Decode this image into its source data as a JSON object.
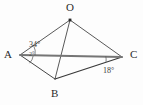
{
  "figure": {
    "kind": "geometry-line-diagram",
    "background_color": "#fdfdfd",
    "line_color": "#3c3c3c",
    "baseline_color": "#6e6e6e",
    "width": 143,
    "height": 105
  },
  "vertices": [
    {
      "id": "O",
      "label": "O",
      "x": 70,
      "y": 20,
      "has_dot": true
    },
    {
      "id": "A",
      "label": "A",
      "x": 20,
      "y": 55,
      "has_dot": false
    },
    {
      "id": "B",
      "label": "B",
      "x": 55,
      "y": 79,
      "has_dot": false
    },
    {
      "id": "C",
      "label": "C",
      "x": 122,
      "y": 57,
      "has_dot": false
    }
  ],
  "edges": [
    {
      "id": "OA",
      "from": "O",
      "to": "A",
      "style": "thin"
    },
    {
      "id": "OB",
      "from": "O",
      "to": "B",
      "style": "thin"
    },
    {
      "id": "OC",
      "from": "O",
      "to": "C",
      "style": "thin"
    },
    {
      "id": "AB",
      "from": "A",
      "to": "B",
      "style": "thin"
    },
    {
      "id": "AC",
      "from": "A",
      "to": "C",
      "style": "baseline"
    },
    {
      "id": "BC",
      "from": "B",
      "to": "C",
      "style": "thin"
    }
  ],
  "angles": {
    "at_A_upper": "34°",
    "at_A_lower": "2°",
    "at_C": "18°"
  }
}
